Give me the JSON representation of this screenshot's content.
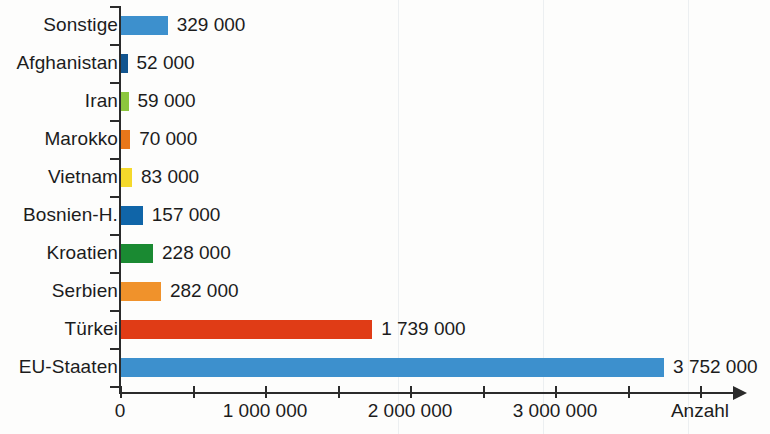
{
  "chart_data": {
    "type": "bar",
    "orientation": "horizontal",
    "title": "",
    "xlabel": "Anzahl",
    "ylabel": "",
    "xlim": [
      0,
      4250000
    ],
    "grid": false,
    "legend": null,
    "xticks": [
      0,
      1000000,
      2000000,
      3000000
    ],
    "xtick_labels": [
      "0",
      "1 000 000",
      "2 000 000",
      "3 000 000"
    ],
    "minor_xticks": [
      500000,
      1500000,
      2500000,
      3500000,
      4000000
    ],
    "categories": [
      "Sonstige",
      "Afghanistan",
      "Iran",
      "Marokko",
      "Vietnam",
      "Bosnien-H.",
      "Kroatien",
      "Serbien",
      "Türkei",
      "EU-Staaten"
    ],
    "values": [
      329000,
      52000,
      59000,
      70000,
      83000,
      157000,
      228000,
      282000,
      1739000,
      3752000
    ],
    "value_labels": [
      "329 000",
      "52 000",
      "59 000",
      "70 000",
      "83 000",
      "157 000",
      "228 000",
      "282 000",
      "1 739 000",
      "3 752 000"
    ],
    "colors": [
      "#3d90cd",
      "#12558f",
      "#8cc63e",
      "#e8771a",
      "#f5d92b",
      "#1065a8",
      "#1a8a32",
      "#f0922b",
      "#e03c16",
      "#3d90cd"
    ]
  }
}
